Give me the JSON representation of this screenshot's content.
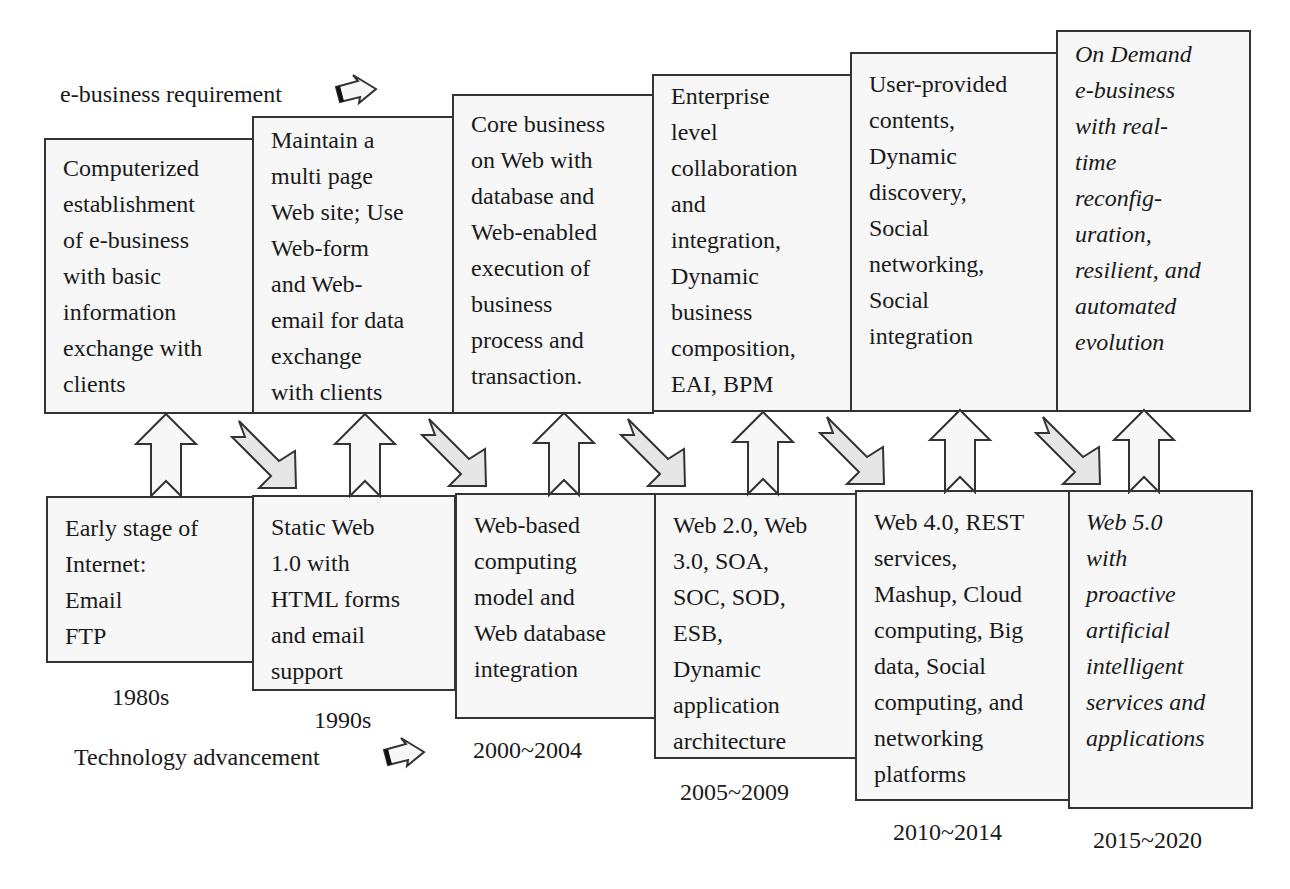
{
  "diagram": {
    "top_label": "e-business requirement",
    "bottom_label": "Technology advancement",
    "colors": {
      "box_fill": "#f7f7f7",
      "border": "#333333",
      "diag_arrow_fill": "#e6e6e6",
      "up_arrow_fill": "#f7f7f7"
    },
    "requirements": [
      {
        "text": "Computerized\nestablishment\nof e-business\nwith basic\ninformation\nexchange with\nclients",
        "italic": false
      },
      {
        "text": "Maintain a\nmulti page\nWeb site; Use\nWeb-form\nand Web-\nemail for data\nexchange\nwith clients",
        "italic": false
      },
      {
        "text": "Core business\non Web with\ndatabase and\nWeb-enabled\nexecution of\nbusiness\nprocess and\ntransaction.",
        "italic": false
      },
      {
        "text": "Enterprise\nlevel\ncollaboration\nand\nintegration,\nDynamic\nbusiness\ncomposition,\nEAI, BPM",
        "italic": false
      },
      {
        "text": "User-provided\ncontents,\nDynamic\ndiscovery,\nSocial\nnetworking,\nSocial\nintegration",
        "italic": false
      },
      {
        "text": "On Demand\ne-business\nwith real-\ntime\nreconfig-\nuration,\nresilient, and\nautomated\nevolution",
        "italic": true
      }
    ],
    "technologies": [
      {
        "text": "Early stage of\nInternet:\nEmail\nFTP",
        "period": "1980s",
        "italic": false
      },
      {
        "text": "Static Web\n1.0 with\nHTML forms\nand email\nsupport",
        "period": "1990s",
        "italic": false
      },
      {
        "text": "Web-based\ncomputing\nmodel and\nWeb database\nintegration",
        "period": "2000~2004",
        "italic": false
      },
      {
        "text": "Web 2.0, Web\n3.0, SOA,\nSOC, SOD,\nESB,\nDynamic\napplication\narchitecture",
        "period": "2005~2009",
        "italic": false
      },
      {
        "text": "Web 4.0, REST\nservices,\nMashup, Cloud\ncomputing, Big\ndata, Social\ncomputing, and\nnetworking\nplatforms",
        "period": "2010~2014",
        "italic": false
      },
      {
        "text": "Web 5.0\nwith\nproactive\nartificial\nintelligent\nservices and\napplications",
        "period": "2015~2020",
        "italic": true
      }
    ],
    "icons": {
      "legend_arrow": "right-block-arrow-icon",
      "support_arrow": "up-block-arrow-icon",
      "progress_arrow": "diagonal-block-arrow-icon"
    }
  }
}
